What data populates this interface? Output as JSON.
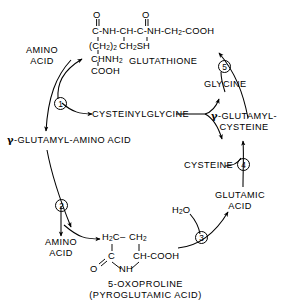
{
  "diagram": {
    "ink_color": "#000000",
    "background_color": "#ffffff"
  },
  "structures": {
    "glutathione": {
      "name": "GLUTATHIONE",
      "row_oxygen_left": "O",
      "row_oxygen_right": "O",
      "backbone": "C-NH-CH-C-NH-CH",
      "backbone_sub": "2",
      "backbone_tail": "-COOH",
      "side_left": "(CH",
      "side_left_sub": "2",
      "side_left_tail": ")",
      "side_left_sub2": "2",
      "side_right": "CH",
      "side_right_sub": "2",
      "side_right_tail": "SH",
      "chain_amine": "CHNH",
      "chain_amine_sub": "2",
      "chain_acid": "COOH"
    },
    "oxoproline": {
      "top_left": "H",
      "top_left_sub": "2",
      "top_left_tail": "C",
      "dash": "–",
      "top_right": "CH",
      "top_right_sub": "2",
      "mid_left": "C",
      "mid_right": "CH-COOH",
      "bot_oxygen": "O",
      "bot_nh": "NH",
      "label_line1": "5-OXOPROLINE",
      "label_line2": "(PYROGLUTAMIC ACID)"
    }
  },
  "labels": {
    "amino_acid_top": "AMINO\nACID",
    "amino_acid_top_l1": "AMINO",
    "amino_acid_top_l2": "ACID",
    "amino_acid_bottom_l1": "AMINO",
    "amino_acid_bottom_l2": "ACID",
    "glutathione": "GLUTATHIONE",
    "glycine": "GLYCINE",
    "cysteinylglycine": "CYSTEINYLGLYCINE",
    "gamma_symbol": "γ",
    "gamma_glutamyl_amino_acid": "-GLUTAMYL-AMINO ACID",
    "gamma_glutamyl_cysteine_l1": "-GLUTAMYL-",
    "gamma_glutamyl_cysteine_l2": "CYSTEINE",
    "cysteine": "CYSTEINE",
    "glutamic_acid_l1": "GLUTAMIC",
    "glutamic_acid_l2": "ACID",
    "water": "H",
    "water_sub": "2",
    "water_tail": "O"
  },
  "steps": [
    {
      "id": "1",
      "number": "1"
    },
    {
      "id": "2",
      "number": "2"
    },
    {
      "id": "3",
      "number": "3"
    },
    {
      "id": "4",
      "number": "4"
    },
    {
      "id": "5",
      "number": "5"
    }
  ]
}
